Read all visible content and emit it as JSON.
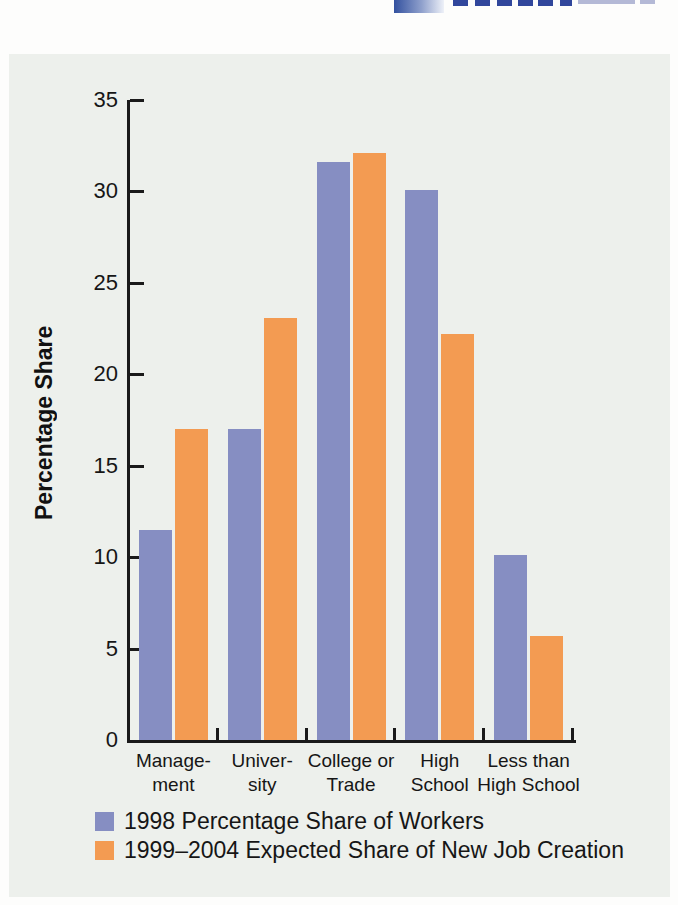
{
  "page": {
    "background_color": "#fdfdfc",
    "panel_background_color": "#edf0ec",
    "axis_color": "#1a1a1a"
  },
  "logo_fragment": {
    "description": "cropped-blue-logo-top-edge",
    "navy_color": "#31479c",
    "gradient_start_color": "#33519f"
  },
  "chart_data": {
    "type": "bar",
    "title": "",
    "xlabel": "",
    "ylabel": "Percentage Share",
    "ylim": [
      0,
      35
    ],
    "yticks": [
      0,
      5,
      10,
      15,
      20,
      25,
      30,
      35
    ],
    "grid": false,
    "legend_position": "bottom-left",
    "categories": [
      "Management",
      "University",
      "College or Trade",
      "High School",
      "Less than High School"
    ],
    "category_tick_lines": [
      [
        "Manage-",
        "ment"
      ],
      [
        "Univer-",
        "sity"
      ],
      [
        "College or",
        "Trade"
      ],
      [
        "High",
        "School"
      ],
      [
        "Less than",
        "High School"
      ]
    ],
    "series": [
      {
        "name": "1998 Percentage Share of Workers",
        "color": "#868ec2",
        "values": [
          11.5,
          17.0,
          31.6,
          30.1,
          10.1
        ]
      },
      {
        "name": "1999–2004 Expected Share of New Job Creation",
        "color": "#f39b52",
        "values": [
          17.0,
          23.1,
          32.1,
          22.2,
          5.7
        ]
      }
    ]
  }
}
